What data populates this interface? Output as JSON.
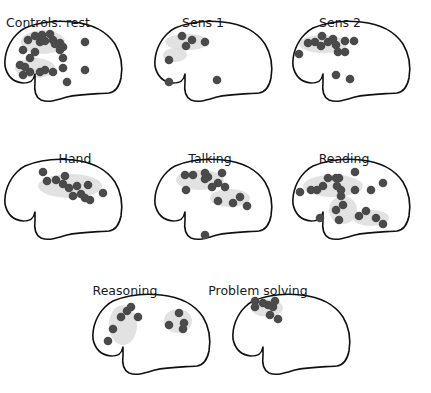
{
  "figure": {
    "colors": {
      "outline": "#111111",
      "dot": "#4a4a4a",
      "halo": "#d8d8d8",
      "background": "#ffffff"
    },
    "panels": [
      {
        "id": "controls-rest",
        "label": "Controls: rest",
        "origin": [
          15,
          30
        ],
        "dots": [
          [
            13,
            10
          ],
          [
            20,
            6
          ],
          [
            27,
            5
          ],
          [
            35,
            4
          ],
          [
            25,
            12
          ],
          [
            30,
            11
          ],
          [
            38,
            10
          ],
          [
            45,
            13
          ],
          [
            48,
            17
          ],
          [
            45,
            20
          ],
          [
            40,
            14
          ],
          [
            20,
            22
          ],
          [
            15,
            28
          ],
          [
            8,
            20
          ],
          [
            5,
            35
          ],
          [
            10,
            37
          ],
          [
            8,
            45
          ],
          [
            15,
            42
          ],
          [
            25,
            42
          ],
          [
            30,
            40
          ],
          [
            38,
            42
          ],
          [
            48,
            38
          ],
          [
            48,
            28
          ],
          [
            52,
            52
          ],
          [
            70,
            12
          ],
          [
            70,
            40
          ]
        ],
        "halos": [
          [
            28,
            12,
            22,
            12
          ],
          [
            20,
            38,
            20,
            10
          ]
        ]
      },
      {
        "id": "sens-1",
        "label": "Sens 1",
        "origin": [
          165,
          30
        ],
        "dots": [
          [
            17,
            6
          ],
          [
            21,
            16
          ],
          [
            27,
            10
          ],
          [
            40,
            12
          ],
          [
            4,
            30
          ],
          [
            4,
            52
          ],
          [
            52,
            50
          ]
        ],
        "halos": [
          [
            22,
            12,
            22,
            8
          ],
          [
            10,
            25,
            12,
            7
          ]
        ]
      },
      {
        "id": "sens-2",
        "label": "Sens 2",
        "origin": [
          303,
          30
        ],
        "dots": [
          [
            5,
            13
          ],
          [
            12,
            12
          ],
          [
            19,
            6
          ],
          [
            18,
            16
          ],
          [
            25,
            12
          ],
          [
            30,
            9
          ],
          [
            33,
            15
          ],
          [
            42,
            11
          ],
          [
            51,
            11
          ],
          [
            -4,
            24
          ],
          [
            35,
            22
          ],
          [
            42,
            22
          ],
          [
            33,
            45
          ],
          [
            47,
            49
          ]
        ],
        "halos": [
          [
            20,
            14,
            24,
            9
          ]
        ]
      },
      {
        "id": "hand",
        "label": "Hand",
        "origin": [
          15,
          168
        ],
        "dots": [
          [
            28,
            4
          ],
          [
            32,
            13
          ],
          [
            41,
            12
          ],
          [
            48,
            16
          ],
          [
            54,
            20
          ],
          [
            50,
            8
          ],
          [
            62,
            18
          ],
          [
            58,
            28
          ],
          [
            66,
            26
          ],
          [
            70,
            30
          ],
          [
            73,
            17
          ],
          [
            88,
            25
          ],
          [
            75,
            32
          ]
        ],
        "halos": [
          [
            55,
            18,
            32,
            12
          ]
        ]
      },
      {
        "id": "talking",
        "label": "Talking",
        "origin": [
          165,
          168
        ],
        "dots": [
          [
            20,
            7
          ],
          [
            28,
            7
          ],
          [
            40,
            5
          ],
          [
            43,
            9
          ],
          [
            57,
            5
          ],
          [
            53,
            15
          ],
          [
            60,
            19
          ],
          [
            47,
            19
          ],
          [
            40,
            11
          ],
          [
            21,
            22
          ],
          [
            53,
            33
          ],
          [
            68,
            35
          ],
          [
            75,
            29
          ],
          [
            82,
            38
          ],
          [
            40,
            67
          ]
        ],
        "halos": [
          [
            35,
            12,
            24,
            10
          ],
          [
            65,
            30,
            20,
            9
          ]
        ]
      },
      {
        "id": "reading",
        "label": "Reading",
        "origin": [
          303,
          168
        ],
        "dots": [
          [
            -3,
            24
          ],
          [
            8,
            22
          ],
          [
            14,
            22
          ],
          [
            20,
            18
          ],
          [
            25,
            10
          ],
          [
            33,
            10
          ],
          [
            36,
            10
          ],
          [
            34,
            18
          ],
          [
            38,
            22
          ],
          [
            38,
            28
          ],
          [
            52,
            4
          ],
          [
            52,
            22
          ],
          [
            68,
            22
          ],
          [
            80,
            15
          ],
          [
            40,
            37
          ],
          [
            33,
            42
          ],
          [
            17,
            50
          ],
          [
            36,
            52
          ],
          [
            56,
            48
          ],
          [
            63,
            43
          ],
          [
            73,
            50
          ],
          [
            80,
            56
          ]
        ],
        "halos": [
          [
            30,
            18,
            30,
            11
          ],
          [
            40,
            42,
            14,
            14
          ],
          [
            68,
            50,
            18,
            8
          ]
        ]
      },
      {
        "id": "reasoning",
        "label": "Reasoning",
        "origin": [
          103,
          303
        ],
        "dots": [
          [
            24,
            8
          ],
          [
            28,
            4
          ],
          [
            18,
            14
          ],
          [
            35,
            14
          ],
          [
            10,
            26
          ],
          [
            5,
            38
          ],
          [
            76,
            10
          ],
          [
            66,
            22
          ],
          [
            81,
            20
          ],
          [
            80,
            26
          ]
        ],
        "halos": [
          [
            20,
            22,
            14,
            20
          ],
          [
            75,
            18,
            14,
            12
          ]
        ]
      },
      {
        "id": "problem-solving",
        "label": "Problem solving",
        "origin": [
          243,
          303
        ],
        "dots": [
          [
            12,
            -2
          ],
          [
            12,
            4
          ],
          [
            20,
            0
          ],
          [
            25,
            2
          ],
          [
            30,
            4
          ],
          [
            32,
            -2
          ],
          [
            27,
            12
          ],
          [
            35,
            16
          ]
        ],
        "halos": [
          [
            24,
            5,
            16,
            9
          ]
        ]
      }
    ],
    "label_positions": [
      [
        48,
        27
      ],
      [
        203,
        27
      ],
      [
        340,
        27
      ],
      [
        75,
        163
      ],
      [
        210,
        163
      ],
      [
        344,
        163
      ],
      [
        125,
        295
      ],
      [
        258,
        295
      ]
    ]
  }
}
